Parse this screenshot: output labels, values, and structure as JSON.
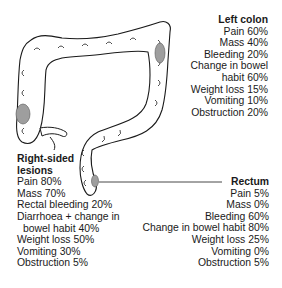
{
  "diagram": {
    "subject": "colon",
    "lesion_color": "#9e9e9e",
    "outline_color": "#1a1a1a"
  },
  "left_colon": {
    "title": "Left colon",
    "items": [
      "Pain 60%",
      "Mass 40%",
      "Bleeding 20%",
      "Change in bowel",
      "habit 60%",
      "Weight loss 15%",
      "Vomiting 10%",
      "Obstruction 20%"
    ]
  },
  "right_sided": {
    "title_line1": "Right-sided",
    "title_line2": "lesions",
    "items": [
      "Pain 80%",
      "Mass 70%",
      "Rectal bleeding 20%",
      "Diarrhoea + change in",
      "bowel habit 40%",
      "Weight loss 50%",
      "Vomiting 30%",
      "Obstruction 5%"
    ]
  },
  "rectum": {
    "title": "Rectum",
    "items": [
      "Pain 5%",
      "Mass 0%",
      "Bleeding 60%",
      "Change in bowel habit 80%",
      "Weight loss 25%",
      "Vomiting 0%",
      "Obstruction 5%"
    ]
  }
}
